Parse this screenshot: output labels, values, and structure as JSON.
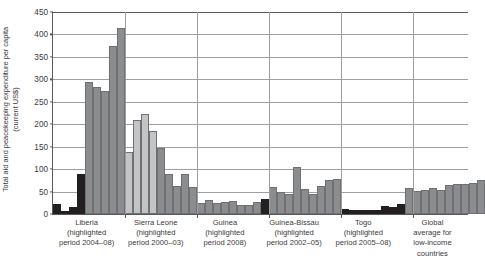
{
  "chart_data": {
    "type": "bar",
    "title": "",
    "xlabel": "",
    "ylabel": "Total aid and peacekeeping expenditure per capita (current US$)",
    "ylim": [
      0,
      450
    ],
    "yticks": [
      0,
      50,
      100,
      150,
      200,
      250,
      300,
      350,
      400,
      450
    ],
    "grid": true,
    "legend": "none",
    "colors": {
      "highlighted_dark": "#231f20",
      "bar_mid_gray": "#8b8c8e",
      "bar_light_gray": "#c3c4c6",
      "axis": "#58595b",
      "gridline": "#9d9fa2",
      "background": "#ffffff"
    },
    "groups": [
      {
        "name": "Liberia",
        "sub_line1": "(highlighted",
        "sub_line2": "period 2004–08)",
        "highlight_period": "2004–08",
        "bars": [
          {
            "value": 22,
            "shade": "dark"
          },
          {
            "value": 7,
            "shade": "dark"
          },
          {
            "value": 16,
            "shade": "dark"
          },
          {
            "value": 90,
            "shade": "dark"
          },
          {
            "value": 293,
            "shade": "mid"
          },
          {
            "value": 283,
            "shade": "mid"
          },
          {
            "value": 274,
            "shade": "mid"
          },
          {
            "value": 375,
            "shade": "mid"
          },
          {
            "value": 414,
            "shade": "mid"
          }
        ]
      },
      {
        "name": "Sierra Leone",
        "sub_line1": "(highlighted",
        "sub_line2": "period 2000–03)",
        "highlight_period": "2000–03",
        "bars": [
          {
            "value": 138,
            "shade": "light"
          },
          {
            "value": 209,
            "shade": "light"
          },
          {
            "value": 223,
            "shade": "light"
          },
          {
            "value": 185,
            "shade": "light"
          },
          {
            "value": 148,
            "shade": "mid"
          },
          {
            "value": 90,
            "shade": "mid"
          },
          {
            "value": 63,
            "shade": "mid"
          },
          {
            "value": 90,
            "shade": "mid"
          },
          {
            "value": 61,
            "shade": "mid"
          }
        ]
      },
      {
        "name": "Guinea",
        "sub_line1": "(highlighted",
        "sub_line2": "period 2008)",
        "highlight_period": "2008",
        "bars": [
          {
            "value": 24,
            "shade": "mid"
          },
          {
            "value": 31,
            "shade": "mid"
          },
          {
            "value": 25,
            "shade": "mid"
          },
          {
            "value": 26,
            "shade": "mid"
          },
          {
            "value": 28,
            "shade": "mid"
          },
          {
            "value": 20,
            "shade": "mid"
          },
          {
            "value": 21,
            "shade": "mid"
          },
          {
            "value": 26,
            "shade": "mid"
          },
          {
            "value": 34,
            "shade": "dark"
          }
        ]
      },
      {
        "name": "Guinea-Bissau",
        "sub_line1": "(highlighted",
        "sub_line2": "period 2002–05)",
        "highlight_period": "2002–05",
        "bars": [
          {
            "value": 61,
            "shade": "mid"
          },
          {
            "value": 48,
            "shade": "mid"
          },
          {
            "value": 44,
            "shade": "mid"
          },
          {
            "value": 105,
            "shade": "mid"
          },
          {
            "value": 56,
            "shade": "mid"
          },
          {
            "value": 45,
            "shade": "mid"
          },
          {
            "value": 62,
            "shade": "mid"
          },
          {
            "value": 76,
            "shade": "mid"
          },
          {
            "value": 79,
            "shade": "mid"
          }
        ]
      },
      {
        "name": "Togo",
        "sub_line1": "(highlighted",
        "sub_line2": "period 2005–08)",
        "highlight_period": "2005–08",
        "bars": [
          {
            "value": 11,
            "shade": "dark"
          },
          {
            "value": 8,
            "shade": "dark"
          },
          {
            "value": 8,
            "shade": "dark"
          },
          {
            "value": 9,
            "shade": "dark"
          },
          {
            "value": 10,
            "shade": "dark"
          },
          {
            "value": 17,
            "shade": "dark"
          },
          {
            "value": 15,
            "shade": "dark"
          },
          {
            "value": 22,
            "shade": "dark"
          },
          {
            "value": 57,
            "shade": "mid"
          }
        ]
      },
      {
        "name": "Global",
        "sub_line1": "average for",
        "sub_line2": "low-income",
        "sub_line3": "countries",
        "highlight_period": "",
        "bars": [
          {
            "value": 52,
            "shade": "mid"
          },
          {
            "value": 54,
            "shade": "mid"
          },
          {
            "value": 58,
            "shade": "mid"
          },
          {
            "value": 53,
            "shade": "mid"
          },
          {
            "value": 64,
            "shade": "mid"
          },
          {
            "value": 66,
            "shade": "mid"
          },
          {
            "value": 66,
            "shade": "mid"
          },
          {
            "value": 68,
            "shade": "mid"
          },
          {
            "value": 76,
            "shade": "mid"
          }
        ]
      }
    ]
  },
  "axis": {
    "y_title_line1": "Total aid and peacekeeping expenditure per capita",
    "y_title_line2": "(current US$)"
  }
}
